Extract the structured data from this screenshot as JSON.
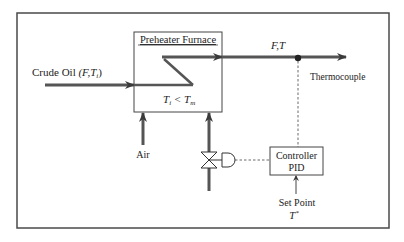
{
  "diagram": {
    "furnace": {
      "title": "Preheater Furnace",
      "condition": "Ti < Tm",
      "condition_main": "T",
      "condition_sub1": "i",
      "condition_op": " < T",
      "condition_sub2": "m"
    },
    "inlet": {
      "label": "Crude Oil",
      "vars": "(F,T",
      "vars_sub": "i",
      "vars_close": ")"
    },
    "outlet": {
      "label": "F,T"
    },
    "sensor": {
      "label": "Thermocouple"
    },
    "air": {
      "label": "Air"
    },
    "controller": {
      "line1": "Controller",
      "line2": "PID"
    },
    "setpoint": {
      "label": "Set Point",
      "symbol": "T",
      "symbol_sup": "*"
    },
    "colors": {
      "line": "#3a3a3a",
      "pipe": "#555555",
      "frame": "#4a4a4a",
      "background": "#ffffff"
    }
  }
}
